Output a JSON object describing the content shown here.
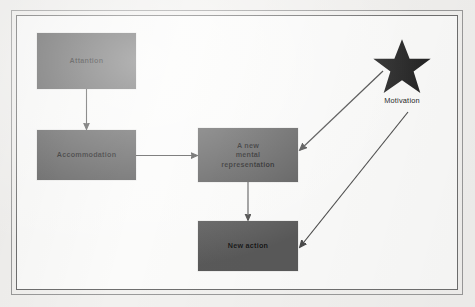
{
  "figure": {
    "type": "flow-diagram",
    "title": "",
    "background_color": "#f2f1ef",
    "node_fill_color": "#595959",
    "arrow_color": "#4a4a4a",
    "star_color": "#262626"
  },
  "nodes": [
    {
      "id": "attention",
      "label": "Attantion",
      "shape": "rectangle"
    },
    {
      "id": "accommodation",
      "label": "Accommodation",
      "shape": "rectangle"
    },
    {
      "id": "representation",
      "label": "A new\nmental\nrepresentation",
      "shape": "rectangle"
    },
    {
      "id": "newaction",
      "label": "New action",
      "shape": "rectangle"
    }
  ],
  "star": {
    "icon": "star-icon",
    "label": "Motivation"
  },
  "edges": [
    {
      "id": "e1",
      "from": "attention",
      "to": "accommodation",
      "direction": "down",
      "arrowhead": true
    },
    {
      "id": "e2",
      "from": "accommodation",
      "to": "representation",
      "direction": "right",
      "arrowhead": true
    },
    {
      "id": "e3",
      "from": "representation",
      "to": "newaction",
      "direction": "down",
      "arrowhead": true
    },
    {
      "id": "e4",
      "from": "star",
      "to": "representation",
      "direction": "down-left",
      "arrowhead": true
    },
    {
      "id": "e5",
      "from": "star",
      "to": "newaction",
      "direction": "down-left",
      "arrowhead": true
    }
  ]
}
